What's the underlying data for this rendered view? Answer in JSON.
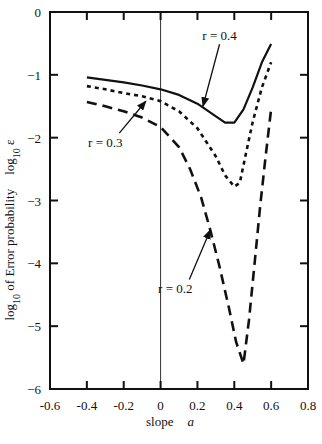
{
  "chart_data": {
    "type": "line",
    "title": "",
    "xlabel": "slope",
    "xlabel_symbol": "a",
    "ylabel": "log10 of Error probability",
    "ylabel_right": "log10 ε",
    "xlim": [
      -0.6,
      0.8
    ],
    "ylim": [
      -6,
      0
    ],
    "xticks": [
      -0.6,
      -0.4,
      -0.2,
      0,
      0.2,
      0.4,
      0.6,
      0.8
    ],
    "xtick_labels": [
      "-0.6",
      "-0.4",
      "-0.2",
      "0",
      "0.2",
      "0.4",
      "0.6",
      "0.8"
    ],
    "yticks": [
      0,
      -1,
      -2,
      -3,
      -4,
      -5,
      -6
    ],
    "ytick_labels": [
      "0",
      "−1",
      "−2",
      "−3",
      "−4",
      "−5",
      "−6"
    ],
    "grid": false,
    "vertical_reference_line_x": 0,
    "legend": "inline annotations with arrows",
    "series": [
      {
        "name": "r = 0.4",
        "style": "solid",
        "x": [
          -0.4,
          -0.3,
          -0.2,
          -0.1,
          0.0,
          0.1,
          0.2,
          0.3,
          0.35,
          0.4,
          0.45,
          0.5,
          0.55,
          0.6
        ],
        "y": [
          -1.04,
          -1.08,
          -1.12,
          -1.17,
          -1.23,
          -1.32,
          -1.46,
          -1.66,
          -1.76,
          -1.76,
          -1.55,
          -1.2,
          -0.8,
          -0.51
        ]
      },
      {
        "name": "r = 0.3",
        "style": "dotted",
        "x": [
          -0.4,
          -0.3,
          -0.2,
          -0.1,
          0.0,
          0.1,
          0.2,
          0.3,
          0.35,
          0.4,
          0.43,
          0.46,
          0.5,
          0.55,
          0.6
        ],
        "y": [
          -1.18,
          -1.23,
          -1.29,
          -1.34,
          -1.42,
          -1.58,
          -1.85,
          -2.3,
          -2.6,
          -2.78,
          -2.72,
          -2.3,
          -1.75,
          -1.2,
          -0.8
        ]
      },
      {
        "name": "r = 0.2",
        "style": "dashed",
        "x": [
          -0.4,
          -0.3,
          -0.2,
          -0.1,
          0.0,
          0.1,
          0.16,
          0.22,
          0.27,
          0.32,
          0.37,
          0.41,
          0.45,
          0.48,
          0.51,
          0.54,
          0.57,
          0.6
        ],
        "y": [
          -1.43,
          -1.5,
          -1.58,
          -1.68,
          -1.83,
          -2.15,
          -2.5,
          -2.95,
          -3.47,
          -4.05,
          -4.7,
          -5.25,
          -5.6,
          -4.9,
          -4.0,
          -3.1,
          -2.3,
          -1.55
        ]
      }
    ],
    "annotations": [
      {
        "text": "r = 0.4",
        "label_xy": [
          0.32,
          -0.45
        ],
        "arrow_to": [
          0.23,
          -1.5
        ]
      },
      {
        "text": "r = 0.3",
        "label_xy": [
          -0.3,
          -2.15
        ],
        "arrow_to": [
          -0.08,
          -1.42
        ]
      },
      {
        "text": "r = 0.2",
        "label_xy": [
          0.08,
          -4.48
        ],
        "arrow_to": [
          0.27,
          -3.47
        ]
      }
    ]
  }
}
